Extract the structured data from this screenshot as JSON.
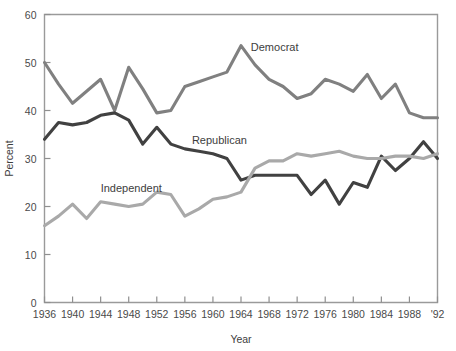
{
  "chart_data": {
    "type": "line",
    "title": "",
    "xlabel": "Year",
    "ylabel": "Percent",
    "xlim": [
      1936,
      1992
    ],
    "ylim": [
      0,
      60
    ],
    "grid": false,
    "legend_position": "inline-annotations",
    "x": [
      1936,
      1938,
      1940,
      1942,
      1944,
      1946,
      1948,
      1950,
      1952,
      1954,
      1956,
      1958,
      1960,
      1962,
      1964,
      1966,
      1968,
      1970,
      1972,
      1974,
      1976,
      1978,
      1980,
      1982,
      1984,
      1986,
      1988,
      1990,
      1992
    ],
    "xticks": [
      "1936",
      "1940",
      "1944",
      "1948",
      "1952",
      "1956",
      "1960",
      "1964",
      "1968",
      "1972",
      "1976",
      "1980",
      "1984",
      "1988",
      "'92"
    ],
    "xtick_values": [
      1936,
      1940,
      1944,
      1948,
      1952,
      1956,
      1960,
      1964,
      1968,
      1972,
      1976,
      1980,
      1984,
      1988,
      1992
    ],
    "yticks": [
      "0",
      "10",
      "20",
      "30",
      "40",
      "50",
      "60"
    ],
    "ytick_values": [
      0,
      10,
      20,
      30,
      40,
      50,
      60
    ],
    "series": [
      {
        "name": "Democrat",
        "color": "#808080",
        "label_x": 1965.4,
        "label_y": 52.5,
        "values": [
          50.0,
          45.5,
          41.5,
          44.0,
          46.5,
          40.0,
          49.0,
          44.5,
          39.5,
          40.0,
          45.0,
          46.0,
          47.0,
          48.0,
          53.5,
          49.5,
          46.5,
          45.0,
          42.5,
          43.5,
          46.5,
          45.5,
          44.0,
          47.5,
          42.5,
          45.5,
          39.5,
          38.5,
          38.5
        ]
      },
      {
        "name": "Republican",
        "color": "#414141",
        "label_x": 1957.0,
        "label_y": 33.0,
        "values": [
          34.0,
          37.5,
          37.0,
          37.5,
          39.0,
          39.5,
          38.0,
          33.0,
          36.5,
          33.0,
          32.0,
          31.5,
          31.0,
          30.0,
          25.5,
          26.5,
          26.5,
          26.5,
          26.5,
          22.5,
          25.5,
          20.5,
          25.0,
          24.0,
          30.5,
          27.5,
          30.0,
          33.5,
          30.0
        ]
      },
      {
        "name": "Independent",
        "color": "#a9a9a9",
        "label_x": 1944.0,
        "label_y": 23.0,
        "values": [
          16.0,
          18.0,
          20.5,
          17.5,
          21.0,
          20.5,
          20.0,
          20.5,
          23.0,
          22.5,
          18.0,
          19.5,
          21.5,
          22.0,
          23.0,
          28.0,
          29.5,
          29.5,
          31.0,
          30.5,
          31.0,
          31.5,
          30.5,
          30.0,
          30.0,
          30.5,
          30.5,
          30.0,
          31.0
        ]
      }
    ]
  },
  "axes": {
    "y_title": "Percent",
    "x_title": "Year"
  }
}
